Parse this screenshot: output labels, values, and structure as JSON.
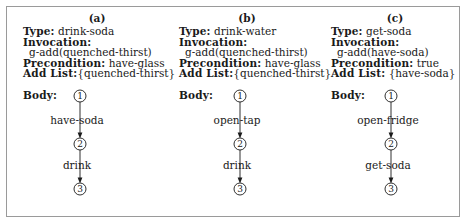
{
  "figure": {
    "border_color": "#9a9a9a",
    "background": "#ffffff",
    "text_color": "#1a1a1a"
  },
  "labels": {
    "type": "Type:",
    "invocation": "Invocation:",
    "precondition": "Precondition:",
    "add_list": "Add List:",
    "body": "Body:"
  },
  "panels": [
    {
      "caption": "(a)",
      "type_value": "drink-soda",
      "invocation_value": "g-add(quenched-thirst)",
      "precondition_value": "have-glass",
      "add_list_value": "{quenched-thirst}",
      "nodes": [
        "1",
        "2",
        "3"
      ],
      "edges": [
        "have-soda",
        "drink"
      ]
    },
    {
      "caption": "(b)",
      "type_value": "drink-water",
      "invocation_value": "g-add(quenched-thirst)",
      "precondition_value": "have-glass",
      "add_list_value": "{quenched-thirst}",
      "nodes": [
        "1",
        "2",
        "3"
      ],
      "edges": [
        "open-tap",
        "drink"
      ]
    },
    {
      "caption": "(c)",
      "type_value": "get-soda",
      "invocation_value": "g-add(have-soda)",
      "precondition_value": "true",
      "add_list_value": " {have-soda}",
      "nodes": [
        "1",
        "2",
        "3"
      ],
      "edges": [
        "open-fridge",
        "get-soda"
      ]
    }
  ]
}
